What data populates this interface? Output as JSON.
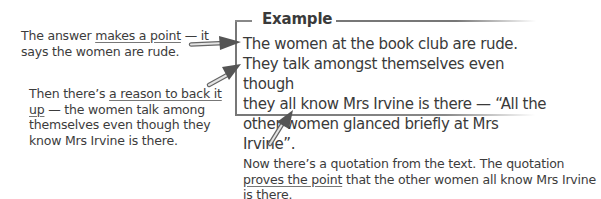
{
  "example": {
    "title": "Example",
    "lines": [
      "The women at the book club are rude.",
      "They talk amongst themselves even though",
      "they all know Mrs Irvine is there — “All the",
      "other women glanced briefly at Mrs Irvine”."
    ]
  },
  "annotations": [
    {
      "pre": "The answer ",
      "underlined": "makes a point",
      "post": " — it says the women are rude."
    },
    {
      "pre": "Then there’s ",
      "underlined": "a reason to back it up",
      "post": " — the women talk among themselves even though they know Mrs Irvine is there."
    },
    {
      "pre": "Now there’s a quotation from the text.  The quotation ",
      "underlined": "proves the point",
      "post": " that the other women all know Mrs Irvine is there."
    }
  ],
  "arrows": [
    {
      "name": "point-arrow",
      "target": "line 1"
    },
    {
      "name": "reason-arrow",
      "target": "line 2"
    },
    {
      "name": "quotation-arrow",
      "target": "line 4"
    }
  ]
}
